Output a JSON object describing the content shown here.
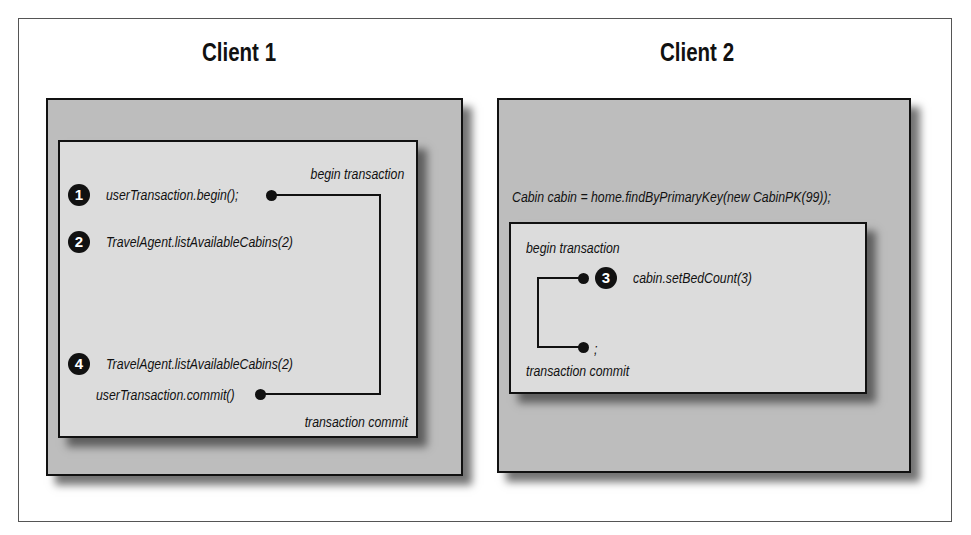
{
  "figure": {
    "client1": {
      "title": "Client 1",
      "begin_label": "begin transaction",
      "commit_label": "transaction commit",
      "steps": [
        {
          "number": "1",
          "code": "userTransaction.begin();"
        },
        {
          "number": "2",
          "code": "TravelAgent.listAvailableCabins(2)"
        },
        {
          "number": "4",
          "code": "TravelAgent.listAvailableCabins(2)"
        }
      ],
      "commit_code": "userTransaction.commit()"
    },
    "client2": {
      "title": "Client 2",
      "lookup_code": "Cabin cabin = home.findByPrimaryKey(new CabinPK(99));",
      "begin_label": "begin transaction",
      "commit_label": "transaction commit",
      "step": {
        "number": "3",
        "code": "cabin.setBedCount(3)"
      },
      "end_code": ";"
    }
  },
  "colors": {
    "outer_box": "#bdbdbd",
    "inner_box": "#dcdcdc",
    "ink": "#111111"
  }
}
